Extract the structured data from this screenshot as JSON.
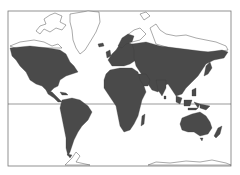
{
  "map": {
    "projection": "mercator",
    "style": "world-outline-shaded-land",
    "colors": {
      "land": "#4a4a4a",
      "background": "#ffffff",
      "frame": "#777777",
      "ice_outline": "#555555"
    },
    "features": {
      "equator_line": true,
      "frame": true,
      "unshaded_regions": [
        "Greenland",
        "Canadian Arctic Archipelago",
        "Arctic Siberian coast",
        "Antarctica"
      ]
    }
  }
}
